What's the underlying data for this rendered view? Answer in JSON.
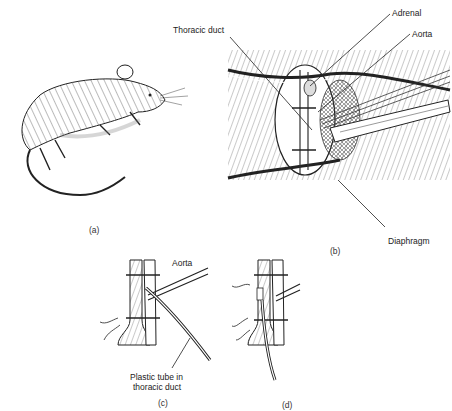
{
  "figure": {
    "panels": [
      {
        "id": "a",
        "label": "(a)",
        "subject": "rat"
      },
      {
        "id": "b",
        "label": "(b)",
        "subject": "surgical exposure of thoracic duct"
      },
      {
        "id": "c",
        "label": "(c)",
        "subject": "plastic tube inserted in thoracic duct"
      },
      {
        "id": "d",
        "label": "(d)",
        "subject": "cannulated thoracic duct ligated"
      }
    ],
    "annotations": {
      "thoracic_duct": "Thoracic duct",
      "adrenal": "Adrenal",
      "aorta_b": "Aorta",
      "diaphragm": "Diaphragm",
      "aorta_c": "Aorta",
      "plastic_tube_line1": "Plastic tube in",
      "plastic_tube_line2": "thoracic duct"
    },
    "colors": {
      "ink": "#222222",
      "background": "#ffffff",
      "hatch": "#555555"
    }
  }
}
